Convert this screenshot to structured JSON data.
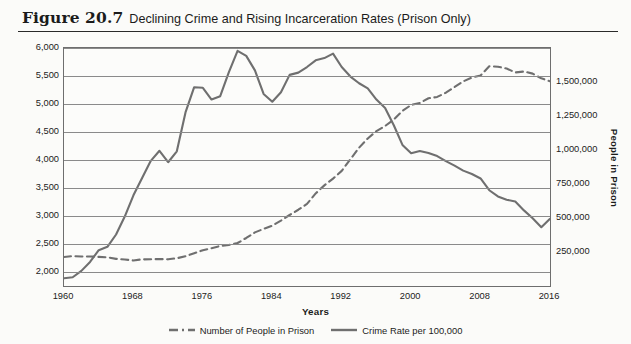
{
  "figure": {
    "number": "Figure 20.7",
    "title": "Declining Crime and Rising Incarceration Rates (Prison Only)"
  },
  "axis": {
    "left_title": "Crime Rate",
    "right_title": "People in Prison",
    "x_title": "Years"
  },
  "legend": {
    "items": [
      {
        "label": "Number of People in Prison",
        "style": "dashed",
        "color": "#6f6f6f"
      },
      {
        "label": "Crime Rate per 100,000",
        "style": "solid",
        "color": "#6f6f6f"
      }
    ]
  },
  "colors": {
    "background": "#fbfbf9",
    "plot_background": "#fcfcfa",
    "gridline": "#8a8a8a",
    "frame": "#6e6e6e",
    "crime_line": "#6f6f6f",
    "prison_line": "#6f6f6f",
    "text": "#1b1b1b"
  },
  "chart_data": {
    "type": "line",
    "title": "Declining Crime and Rising Incarceration Rates (Prison Only)",
    "xlabel": "Years",
    "ylabel": "Crime Rate",
    "y2label": "People in Prison",
    "grid": true,
    "legend_position": "bottom",
    "xlim": [
      1960,
      2016
    ],
    "ylim": [
      1750,
      6000
    ],
    "y2lim": [
      0,
      1750000
    ],
    "xticks": [
      1960,
      1968,
      1976,
      1984,
      1992,
      2000,
      2008,
      2016
    ],
    "xticklabels": [
      "1960",
      "1968",
      "1976",
      "1984",
      "1992",
      "2000",
      "2008",
      "2016"
    ],
    "yticks": [
      2000,
      2500,
      3000,
      3500,
      4000,
      4500,
      5000,
      5500,
      6000
    ],
    "yticklabels": [
      "2,000",
      "2,500",
      "3,000",
      "3,500",
      "4,000",
      "4,500",
      "5,000",
      "5,500",
      "6,000"
    ],
    "y2ticks": [
      250000,
      500000,
      750000,
      1000000,
      1250000,
      1500000
    ],
    "y2ticklabels": [
      "250,000",
      "500,000",
      "750,000",
      "1,000,000",
      "1,250,000",
      "1,500,000"
    ],
    "x": [
      1960,
      1961,
      1962,
      1963,
      1964,
      1965,
      1966,
      1967,
      1968,
      1969,
      1970,
      1971,
      1972,
      1973,
      1974,
      1975,
      1976,
      1977,
      1978,
      1979,
      1980,
      1981,
      1982,
      1983,
      1984,
      1985,
      1986,
      1987,
      1988,
      1989,
      1990,
      1991,
      1992,
      1993,
      1994,
      1995,
      1996,
      1997,
      1998,
      1999,
      2000,
      2001,
      2002,
      2003,
      2004,
      2005,
      2006,
      2007,
      2008,
      2009,
      2010,
      2011,
      2012,
      2013,
      2014,
      2015,
      2016
    ],
    "series": [
      {
        "name": "Crime Rate per 100,000",
        "axis": "left",
        "style": "solid",
        "color": "#6f6f6f",
        "values": [
          1887,
          1906,
          2020,
          2180,
          2390,
          2450,
          2670,
          2990,
          3370,
          3680,
          3985,
          4165,
          3960,
          4155,
          4850,
          5300,
          5290,
          5080,
          5140,
          5570,
          5950,
          5860,
          5600,
          5180,
          5040,
          5210,
          5520,
          5560,
          5660,
          5780,
          5820,
          5900,
          5660,
          5490,
          5370,
          5280,
          5080,
          4930,
          4620,
          4270,
          4120,
          4160,
          4125,
          4070,
          3980,
          3900,
          3810,
          3750,
          3670,
          3460,
          3350,
          3290,
          3260,
          3100,
          2960,
          2800,
          2950
        ]
      },
      {
        "name": "Number of People in Prison",
        "axis": "right",
        "style": "dashed",
        "color": "#6f6f6f",
        "values": [
          212953,
          220149,
          217283,
          217283,
          214336,
          210895,
          199654,
          194896,
          187914,
          196007,
          196441,
          198061,
          196092,
          204211,
          218466,
          240593,
          262833,
          278141,
          294396,
          301470,
          315974,
          353167,
          394374,
          419820,
          443398,
          480568,
          522084,
          560812,
          603732,
          680907,
          739980,
          789610,
          846277,
          932074,
          1016691,
          1085022,
          1138984,
          1176564,
          1224469,
          1287172,
          1331278,
          1345217,
          1380516,
          1390279,
          1421345,
          1462866,
          1504660,
          1532851,
          1547742,
          1615487,
          1612395,
          1598780,
          1570400,
          1576950,
          1561500,
          1526800,
          1505400
        ]
      }
    ],
    "annotations": [
      "Crime rate peaks near 5,950 around 1980 and near 5,900 around 1991.",
      "Crime rate and prison population series cross around 1998-1999.",
      "Prison population peaks near 1,615,000 around 2009 then declines."
    ]
  }
}
